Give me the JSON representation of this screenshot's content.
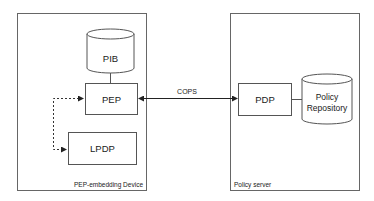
{
  "diagram": {
    "containers": [
      {
        "id": "device",
        "label": "PEP-embedding Device"
      },
      {
        "id": "server",
        "label": "Policy server"
      }
    ],
    "nodes": {
      "pib": {
        "label": "PIB",
        "shape": "cylinder"
      },
      "pep": {
        "label": "PEP",
        "shape": "rectangle"
      },
      "lpdp": {
        "label": "LPDP",
        "shape": "rectangle"
      },
      "pdp": {
        "label": "PDP",
        "shape": "rectangle"
      },
      "repo": {
        "label_line1": "Policy",
        "label_line2": "Repository",
        "shape": "cylinder"
      }
    },
    "edges": [
      {
        "from": "pib",
        "to": "pep",
        "style": "solid",
        "label": ""
      },
      {
        "from": "pep",
        "to": "pdp",
        "style": "solid-bidirectional-arrow",
        "label": "COPS"
      },
      {
        "from": "pdp",
        "to": "repo",
        "style": "solid",
        "label": ""
      },
      {
        "from": "pep",
        "to": "lpdp",
        "style": "dashed-bidirectional-arrow",
        "label": ""
      }
    ],
    "colors": {
      "stroke": "#555555",
      "text": "#1a1a1a",
      "background": "#ffffff"
    }
  }
}
